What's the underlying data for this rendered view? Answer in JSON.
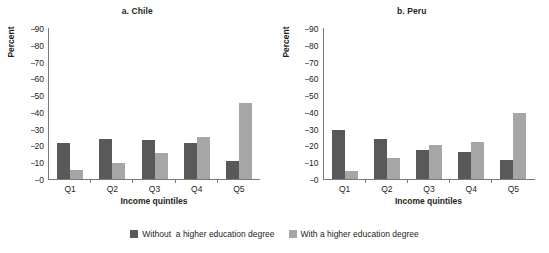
{
  "chart_data": {
    "type": "bar",
    "title": "",
    "panels": [
      {
        "title": "a. Chile",
        "xlabel": "Income quintiles",
        "ylabel": "Percent",
        "categories": [
          "Q1",
          "Q2",
          "Q3",
          "Q4",
          "Q5"
        ],
        "ylim": [
          0,
          90
        ],
        "yticks": [
          0,
          10,
          20,
          30,
          40,
          50,
          60,
          70,
          80,
          90
        ],
        "grid": false,
        "series": [
          {
            "name": "Without  a higher education degree",
            "color": "#595959",
            "values": [
              21.5,
              24.0,
              23.5,
              21.5,
              10.5
            ]
          },
          {
            "name": "With a higher education degree",
            "color": "#a6a6a6",
            "values": [
              5.5,
              9.5,
              15.5,
              25.0,
              45.5
            ]
          }
        ]
      },
      {
        "title": "b. Peru",
        "xlabel": "Income quintiles",
        "ylabel": "Percent",
        "categories": [
          "Q1",
          "Q2",
          "Q3",
          "Q4",
          "Q5"
        ],
        "ylim": [
          0,
          90
        ],
        "yticks": [
          0,
          10,
          20,
          30,
          40,
          50,
          60,
          70,
          80,
          90
        ],
        "grid": false,
        "series": [
          {
            "name": "Without  a higher education degree",
            "color": "#595959",
            "values": [
              29.0,
              24.0,
              17.5,
              16.0,
              11.5
            ]
          },
          {
            "name": "With a higher education degree",
            "color": "#a6a6a6",
            "values": [
              4.5,
              12.5,
              20.5,
              22.0,
              39.5
            ]
          }
        ]
      }
    ],
    "legend": {
      "position": "bottom",
      "entries": [
        {
          "label": "Without  a higher education degree",
          "color": "#595959"
        },
        {
          "label": "With a higher education degree",
          "color": "#a6a6a6"
        }
      ]
    }
  }
}
